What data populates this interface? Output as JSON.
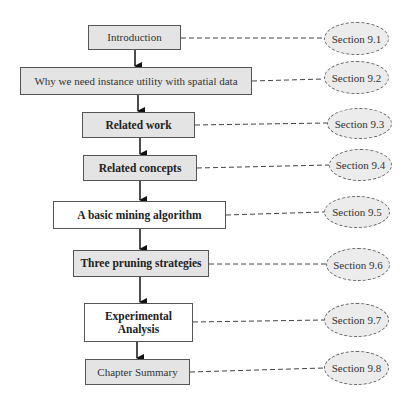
{
  "diagram": {
    "type": "flowchart",
    "steps": [
      {
        "label": "Introduction",
        "section": "Section 9.1",
        "style": "shaded",
        "bold": false
      },
      {
        "label": "Why we need instance utility with spatial data",
        "section": "Section 9.2",
        "style": "shaded",
        "bold": false
      },
      {
        "label": "Related work",
        "section": "Section 9.3",
        "style": "shaded",
        "bold": true
      },
      {
        "label": "Related concepts",
        "section": "Section 9.4",
        "style": "shaded",
        "bold": true
      },
      {
        "label": "A basic mining algorithm",
        "section": "Section 9.5",
        "style": "plain",
        "bold": true
      },
      {
        "label": "Three pruning strategies",
        "section": "Section 9.6",
        "style": "shaded",
        "bold": true
      },
      {
        "label": "Experimental Analysis",
        "label_lines": [
          "Experimental",
          "Analysis"
        ],
        "section": "Section 9.7",
        "style": "plain",
        "bold": true
      },
      {
        "label": "Chapter Summary",
        "section": "Section 9.8",
        "style": "shaded",
        "bold": false
      }
    ],
    "colors": {
      "box_shaded_fill": "#e4e4e4",
      "box_plain_fill": "#ffffff",
      "box_border": "#555555",
      "ellipse_fill": "#ececec",
      "ellipse_border": "#666666",
      "arrow": "#111111",
      "connector": "#444444"
    }
  }
}
